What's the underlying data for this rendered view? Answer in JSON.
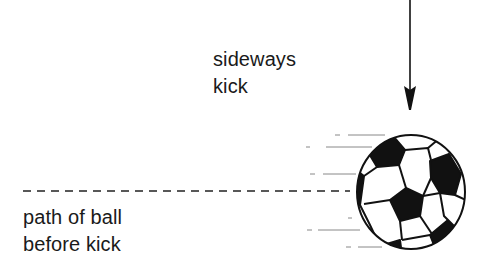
{
  "labels": {
    "kick_line1": "sideways",
    "kick_line2": "kick",
    "path_line1": "path of ball",
    "path_line2": "before kick"
  },
  "colors": {
    "ink": "#111111",
    "background": "#ffffff",
    "speed_lines": "#777777"
  },
  "elements": {
    "arrow": "downward force arrow representing the sideways kick",
    "dashed_line": "original straight path of the ball",
    "ball": "soccer ball with motion speed lines"
  }
}
